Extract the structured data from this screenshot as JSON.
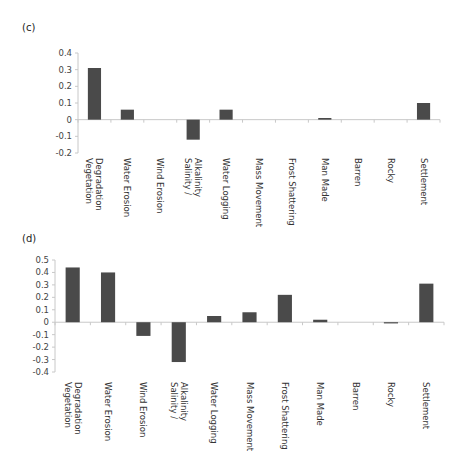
{
  "panels": [
    {
      "label": "(c)"
    },
    {
      "label": "(d)"
    }
  ],
  "colors": {
    "bar": "#4a4a4a",
    "axis": "#c8c8c8",
    "text": "#333333"
  },
  "chart_data": [
    {
      "type": "bar",
      "title": "(c)",
      "xlabel": "",
      "ylabel": "",
      "ylim": [
        -0.2,
        0.4
      ],
      "yticks": [
        "0.4",
        "0.3",
        "0.2",
        "0.1",
        "0",
        "-0.1",
        "-0.2"
      ],
      "grid": false,
      "legend": null,
      "categories": [
        [
          "Vegetation",
          "Degradation"
        ],
        [
          "Water Erosion"
        ],
        [
          "Wind Erosion"
        ],
        [
          "Salinity /",
          "Alkalinity"
        ],
        [
          "Water Logging"
        ],
        [
          "Mass Movement"
        ],
        [
          "Frost Shattering"
        ],
        [
          "Man Made"
        ],
        [
          "Barren"
        ],
        [
          "Rocky"
        ],
        [
          "Settlement"
        ]
      ],
      "values": [
        0.31,
        0.06,
        0.0,
        -0.12,
        0.06,
        0.0,
        0.0,
        0.01,
        0.0,
        0.0,
        0.1
      ]
    },
    {
      "type": "bar",
      "title": "(d)",
      "xlabel": "",
      "ylabel": "",
      "ylim": [
        -0.4,
        0.5
      ],
      "yticks": [
        "0.5",
        "0.4",
        "0.3",
        "0.2",
        "0.1",
        "0",
        "-0.1",
        "-0.2",
        "-0.3",
        "-0.4"
      ],
      "grid": false,
      "legend": null,
      "categories": [
        [
          "Vegetation",
          "Degradation"
        ],
        [
          "Water Erosion"
        ],
        [
          "Wind Erosion"
        ],
        [
          "Salinity /",
          "Alkalinity"
        ],
        [
          "Water Logging"
        ],
        [
          "Mass Movement"
        ],
        [
          "Frost Shattering"
        ],
        [
          "Man Made"
        ],
        [
          "Barren"
        ],
        [
          "Rocky"
        ],
        [
          "Settlement"
        ]
      ],
      "values": [
        0.44,
        0.4,
        -0.11,
        -0.32,
        0.05,
        0.08,
        0.22,
        0.02,
        0.0,
        -0.005,
        0.31
      ]
    }
  ]
}
